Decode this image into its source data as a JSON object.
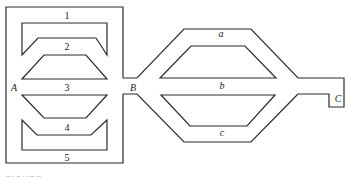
{
  "diagram": {
    "left_block": {
      "path_labels": [
        "1",
        "2",
        "3",
        "4",
        "5"
      ],
      "entry_label": "A"
    },
    "junction_label": "B",
    "right_block": {
      "path_labels": [
        "a",
        "b",
        "c"
      ],
      "exit_label": "C"
    },
    "caption": "FIGURE"
  }
}
